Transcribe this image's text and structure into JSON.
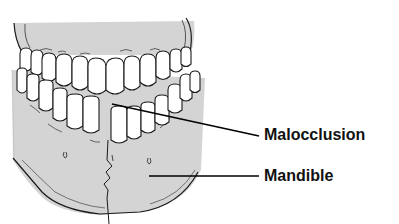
{
  "diagram": {
    "labels": [
      {
        "id": "malocclusion",
        "text": "Malocclusion"
      },
      {
        "id": "mandible",
        "text": "Mandible"
      }
    ],
    "colors": {
      "bone": "#d4d4d4",
      "tooth": "#ffffff",
      "outline": "#1a1a1a",
      "leader_line": "#000000",
      "label_text": "#111111"
    }
  }
}
